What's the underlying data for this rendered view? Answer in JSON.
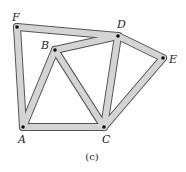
{
  "diagram": {
    "type": "truss",
    "caption": "(c)",
    "colors": {
      "bar_fill": "#d4d4d4",
      "bar_edge": "#555555",
      "node": "#111111"
    },
    "nodes": [
      {
        "id": "F",
        "x": 17,
        "y": 27,
        "label": "F",
        "lx": 12,
        "ly": 21
      },
      {
        "id": "B",
        "x": 55,
        "y": 50,
        "label": "B",
        "lx": 41,
        "ly": 49
      },
      {
        "id": "D",
        "x": 118,
        "y": 36,
        "label": "D",
        "lx": 117,
        "ly": 28
      },
      {
        "id": "E",
        "x": 163,
        "y": 58,
        "label": "E",
        "lx": 169,
        "ly": 63
      },
      {
        "id": "A",
        "x": 23,
        "y": 127,
        "label": "A",
        "lx": 18,
        "ly": 143
      },
      {
        "id": "C",
        "x": 104,
        "y": 127,
        "label": "C",
        "lx": 102,
        "ly": 143
      }
    ],
    "members": [
      [
        "F",
        "D"
      ],
      [
        "F",
        "A"
      ],
      [
        "B",
        "D"
      ],
      [
        "B",
        "A"
      ],
      [
        "B",
        "C"
      ],
      [
        "A",
        "C"
      ],
      [
        "D",
        "C"
      ],
      [
        "D",
        "E"
      ],
      [
        "E",
        "C"
      ]
    ]
  }
}
